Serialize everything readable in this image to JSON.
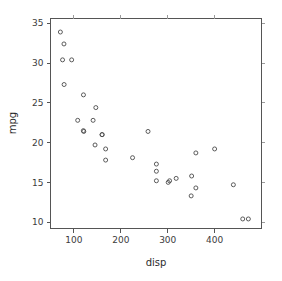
{
  "chart_data": {
    "type": "scatter",
    "title": "",
    "xlabel": "disp",
    "ylabel": "mpg",
    "xlim": [
      50,
      500
    ],
    "ylim": [
      9.2,
      35.6
    ],
    "grid": false,
    "legend": null,
    "xticks": [
      100,
      200,
      300,
      400
    ],
    "yticks": [
      10,
      15,
      20,
      25,
      30,
      35
    ],
    "xtick_labels": [
      "100",
      "200",
      "300",
      "400"
    ],
    "ytick_labels": [
      "10",
      "15",
      "20",
      "25",
      "30",
      "35"
    ],
    "marker": "open-circle",
    "marker_size": 4,
    "point_color": "#4a4a4a",
    "x": [
      160,
      160,
      108,
      258,
      360,
      225,
      360,
      146.7,
      140.8,
      167.6,
      167.6,
      275.8,
      275.8,
      275.8,
      472,
      460,
      440,
      78.7,
      75.7,
      71.1,
      120.1,
      318,
      304,
      350,
      400,
      79,
      120.3,
      95.1,
      351,
      145,
      301,
      121
    ],
    "y": [
      21,
      21,
      22.8,
      21.4,
      18.7,
      18.1,
      14.3,
      24.4,
      22.8,
      19.2,
      17.8,
      16.4,
      17.3,
      15.2,
      10.4,
      10.4,
      14.7,
      32.4,
      30.4,
      33.9,
      21.5,
      15.5,
      15.2,
      13.3,
      19.2,
      27.3,
      26,
      30.4,
      15.8,
      19.7,
      15,
      21.4
    ],
    "n_points": 32,
    "series": [
      {
        "name": "mtcars",
        "points": [
          {
            "x": 160,
            "y": 21
          },
          {
            "x": 160,
            "y": 21
          },
          {
            "x": 108,
            "y": 22.8
          },
          {
            "x": 258,
            "y": 21.4
          },
          {
            "x": 360,
            "y": 18.7
          },
          {
            "x": 225,
            "y": 18.1
          },
          {
            "x": 360,
            "y": 14.3
          },
          {
            "x": 146.7,
            "y": 24.4
          },
          {
            "x": 140.8,
            "y": 22.8
          },
          {
            "x": 167.6,
            "y": 19.2
          },
          {
            "x": 167.6,
            "y": 17.8
          },
          {
            "x": 275.8,
            "y": 16.4
          },
          {
            "x": 275.8,
            "y": 17.3
          },
          {
            "x": 275.8,
            "y": 15.2
          },
          {
            "x": 472,
            "y": 10.4
          },
          {
            "x": 460,
            "y": 10.4
          },
          {
            "x": 440,
            "y": 14.7
          },
          {
            "x": 78.7,
            "y": 32.4
          },
          {
            "x": 75.7,
            "y": 30.4
          },
          {
            "x": 71.1,
            "y": 33.9
          },
          {
            "x": 120.1,
            "y": 21.5
          },
          {
            "x": 318,
            "y": 15.5
          },
          {
            "x": 304,
            "y": 15.2
          },
          {
            "x": 350,
            "y": 13.3
          },
          {
            "x": 400,
            "y": 19.2
          },
          {
            "x": 79,
            "y": 27.3
          },
          {
            "x": 120.3,
            "y": 26
          },
          {
            "x": 95.1,
            "y": 30.4
          },
          {
            "x": 351,
            "y": 15.8
          },
          {
            "x": 145,
            "y": 19.7
          },
          {
            "x": 301,
            "y": 15
          },
          {
            "x": 121,
            "y": 21.4
          }
        ]
      }
    ]
  }
}
